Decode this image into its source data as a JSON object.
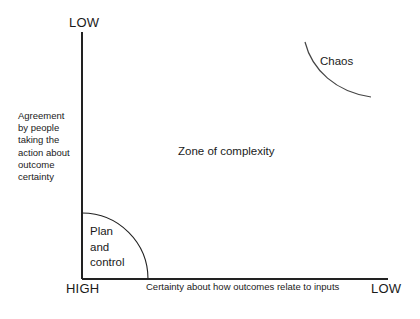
{
  "diagram": {
    "axes": {
      "y_axis_label": "Agreement\nby people\ntaking the\naction about\noutcome\ncertainty",
      "x_axis_label": "Certainty about how outcomes relate to inputs",
      "y_top_marker": "LOW",
      "x_left_marker": "HIGH",
      "x_right_marker": "LOW",
      "line_color": "#222222"
    },
    "regions": [
      {
        "id": "plan-and-control",
        "label": "Plan\nand\ncontrol",
        "shape": "quarter-circle-arc",
        "position": "bottom-left"
      },
      {
        "id": "zone-of-complexity",
        "label": "Zone of complexity",
        "shape": "open-area",
        "position": "center"
      },
      {
        "id": "chaos",
        "label": "Chaos",
        "shape": "concave-arc",
        "position": "top-right"
      }
    ]
  }
}
